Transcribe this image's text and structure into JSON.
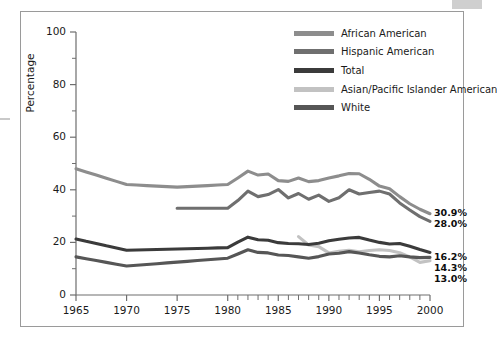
{
  "figure": {
    "background_color": "#ffffff",
    "frame_color": "#9a9a9a"
  },
  "chart_data": {
    "type": "line",
    "title": "",
    "xlabel": "",
    "ylabel": "Percentage",
    "xlim": [
      1965,
      2000
    ],
    "ylim": [
      0,
      100
    ],
    "grid": false,
    "legend_position": "top-right",
    "y_ticks": [
      0,
      20,
      40,
      60,
      80,
      100
    ],
    "y_tick_labels": [
      "0",
      "20",
      "40",
      "60",
      "80",
      "100"
    ],
    "y_minor_ticks": [
      10,
      30,
      50,
      70,
      90
    ],
    "x_tick_labels": [
      "1965",
      "1970",
      "1975",
      "1980",
      "1985",
      "1990",
      "1995",
      "2000"
    ],
    "x_major_ticks": [
      1965,
      1970,
      1975,
      1980,
      1985,
      1990,
      1995,
      2000
    ],
    "x_annual_ticks": [
      1980,
      1981,
      1982,
      1983,
      1984,
      1985,
      1986,
      1987,
      1988,
      1989,
      1990,
      1991,
      1992,
      1993,
      1994,
      1995,
      1996,
      1997,
      1998,
      1999,
      2000
    ],
    "series": [
      {
        "name": "African American",
        "color": "#8d8d8d",
        "x": [
          1965,
          1966,
          1967,
          1968,
          1969,
          1970,
          1971,
          1972,
          1973,
          1974,
          1975,
          1976,
          1977,
          1978,
          1979,
          1980,
          1981,
          1982,
          1983,
          1984,
          1985,
          1986,
          1987,
          1988,
          1989,
          1990,
          1991,
          1992,
          1993,
          1994,
          1995,
          1996,
          1997,
          1998,
          1999,
          2000
        ],
        "values": [
          48.0,
          46.8,
          45.6,
          44.4,
          43.2,
          42.0,
          41.8,
          41.6,
          41.4,
          41.2,
          41.0,
          41.2,
          41.4,
          41.6,
          41.8,
          42.0,
          44.5,
          47.1,
          45.6,
          46.0,
          43.5,
          43.2,
          44.5,
          43.1,
          43.5,
          44.5,
          45.3,
          46.2,
          46.1,
          44.0,
          41.4,
          40.4,
          37.4,
          34.7,
          32.6,
          30.9
        ],
        "end_label": "30.9%"
      },
      {
        "name": "Hispanic American",
        "color": "#6f6f6f",
        "x": [
          1975,
          1976,
          1977,
          1978,
          1979,
          1980,
          1981,
          1982,
          1983,
          1984,
          1985,
          1986,
          1987,
          1988,
          1989,
          1990,
          1991,
          1992,
          1993,
          1994,
          1995,
          1996,
          1997,
          1998,
          1999,
          2000
        ],
        "values": [
          33.0,
          33.0,
          33.0,
          33.0,
          33.0,
          33.0,
          35.9,
          39.5,
          37.4,
          38.2,
          40.1,
          36.9,
          38.6,
          36.4,
          38.0,
          35.6,
          37.0,
          40.0,
          38.4,
          39.0,
          39.5,
          38.4,
          35.0,
          32.3,
          29.8,
          28.0
        ],
        "end_label": "28.0%"
      },
      {
        "name": "Total",
        "color": "#3b3b3b",
        "x": [
          1965,
          1966,
          1967,
          1968,
          1969,
          1970,
          1971,
          1972,
          1973,
          1974,
          1975,
          1976,
          1977,
          1978,
          1979,
          1980,
          1981,
          1982,
          1983,
          1984,
          1985,
          1986,
          1987,
          1988,
          1989,
          1990,
          1991,
          1992,
          1993,
          1994,
          1995,
          1996,
          1997,
          1998,
          1999,
          2000
        ],
        "values": [
          21.3,
          20.4,
          19.6,
          18.7,
          17.9,
          17.0,
          17.1,
          17.2,
          17.3,
          17.4,
          17.5,
          17.6,
          17.7,
          17.8,
          17.9,
          18.0,
          20.1,
          22.0,
          21.0,
          20.8,
          19.9,
          19.6,
          19.5,
          19.2,
          19.7,
          20.6,
          21.2,
          21.7,
          21.9,
          20.9,
          20.0,
          19.4,
          19.6,
          18.5,
          17.3,
          16.2
        ],
        "end_label": "16.2%"
      },
      {
        "name": "Asian/Pacific Islander American",
        "color": "#c2c2c2",
        "x": [
          1987,
          1988,
          1989,
          1990,
          1991,
          1992,
          1993,
          1994,
          1995,
          1996,
          1997,
          1998,
          1999,
          2000
        ],
        "values": [
          22.2,
          19.0,
          18.4,
          16.0,
          16.6,
          17.0,
          16.4,
          16.9,
          17.2,
          16.9,
          16.1,
          14.5,
          12.4,
          13.0
        ],
        "end_label": "13.0%"
      },
      {
        "name": "White",
        "color": "#565656",
        "x": [
          1965,
          1966,
          1967,
          1968,
          1969,
          1970,
          1971,
          1972,
          1973,
          1974,
          1975,
          1976,
          1977,
          1978,
          1979,
          1980,
          1981,
          1982,
          1983,
          1984,
          1985,
          1986,
          1987,
          1988,
          1989,
          1990,
          1991,
          1992,
          1993,
          1994,
          1995,
          1996,
          1997,
          1998,
          1999,
          2000
        ],
        "values": [
          14.5,
          13.8,
          13.1,
          12.4,
          11.7,
          11.0,
          11.3,
          11.6,
          11.9,
          12.2,
          12.5,
          12.8,
          13.1,
          13.4,
          13.7,
          14.0,
          15.6,
          17.2,
          16.2,
          16.0,
          15.2,
          15.0,
          14.5,
          14.0,
          14.6,
          15.6,
          15.9,
          16.5,
          16.0,
          15.3,
          14.7,
          14.5,
          14.9,
          14.5,
          14.2,
          14.3
        ],
        "end_label": "14.3%"
      }
    ]
  },
  "legend": {
    "items": [
      {
        "label": "African American",
        "color": "#8d8d8d"
      },
      {
        "label": "Hispanic American",
        "color": "#6f6f6f"
      },
      {
        "label": "Total",
        "color": "#3b3b3b"
      },
      {
        "label": "Asian/Pacific Islander American",
        "color": "#c2c2c2"
      },
      {
        "label": "White",
        "color": "#565656"
      }
    ]
  },
  "end_labels": [
    {
      "text": "30.9%",
      "series": "African American"
    },
    {
      "text": "28.0%",
      "series": "Hispanic American"
    },
    {
      "text": "16.2%",
      "series": "Total"
    },
    {
      "text": "14.3%",
      "series": "White"
    },
    {
      "text": "13.0%",
      "series": "Asian/Pacific Islander American"
    }
  ]
}
